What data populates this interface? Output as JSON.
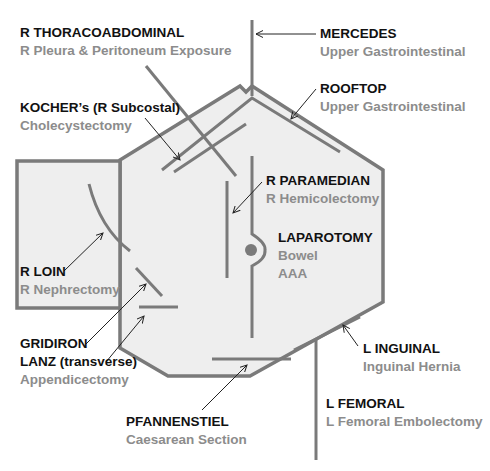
{
  "colors": {
    "outline": "#7a7a7a",
    "fill": "#eeeeee",
    "incision": "#7a7a7a",
    "arrow": "#222222",
    "title_text": "#111111",
    "subtitle_text": "#8c8c8c"
  },
  "incisions": [
    {
      "id": "r-thoracoabdominal",
      "title": "R THORACOABDOMINAL",
      "subtitle": "R Pleura & Peritoneum Exposure"
    },
    {
      "id": "mercedes",
      "title": "MERCEDES",
      "subtitle": "Upper Gastrointestinal"
    },
    {
      "id": "rooftop",
      "title": "ROOFTOP",
      "subtitle": "Upper Gastrointestinal"
    },
    {
      "id": "kocher",
      "title": "KOCHER’s (R Subcostal)",
      "subtitle": "Cholecystectomy"
    },
    {
      "id": "r-paramedian",
      "title": "R PARAMEDIAN",
      "subtitle": "R Hemicolectomy"
    },
    {
      "id": "laparotomy",
      "title": "LAPAROTOMY",
      "subtitle": "Bowel",
      "subtitle2": "AAA"
    },
    {
      "id": "r-loin",
      "title": "R LOIN",
      "subtitle": "R Nephrectomy"
    },
    {
      "id": "gridiron-lanz",
      "title": "GRIDIRON",
      "title2": "LANZ (transverse)",
      "subtitle": "Appendicectomy"
    },
    {
      "id": "l-inguinal",
      "title": "L INGUINAL",
      "subtitle": "Inguinal Hernia"
    },
    {
      "id": "l-femoral",
      "title": "L FEMORAL",
      "subtitle": "L Femoral Embolectomy"
    },
    {
      "id": "pfannenstiel",
      "title": "PFANNENSTIEL",
      "subtitle": "Caesarean Section"
    }
  ]
}
